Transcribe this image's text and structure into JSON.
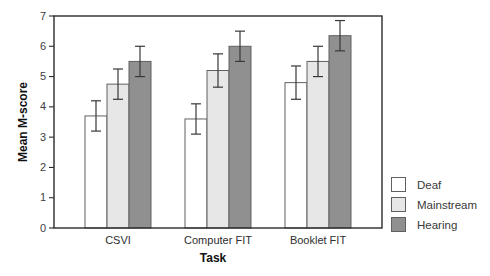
{
  "chart_data": {
    "type": "bar",
    "title": "",
    "xlabel": "Task",
    "ylabel": "Mean M-score",
    "categories": [
      "CSVI",
      "Computer FIT",
      "Booklet FIT"
    ],
    "series": [
      {
        "name": "Deaf",
        "color": "#ffffff",
        "values": [
          3.7,
          3.6,
          4.8
        ],
        "errors": [
          0.5,
          0.5,
          0.55
        ]
      },
      {
        "name": "Mainstream",
        "color": "#e7e7e7",
        "values": [
          4.75,
          5.2,
          5.5
        ],
        "errors": [
          0.5,
          0.55,
          0.5
        ]
      },
      {
        "name": "Hearing",
        "color": "#909090",
        "values": [
          5.5,
          6.0,
          6.35
        ],
        "errors": [
          0.5,
          0.5,
          0.5
        ]
      }
    ],
    "ylim": [
      0,
      7
    ],
    "yticks": [
      0,
      1,
      2,
      3,
      4,
      5,
      6,
      7
    ],
    "grid": false,
    "error_bars": true,
    "legend_position": "outside-right-bottom",
    "axis_color": "#222222",
    "bar_border_color": "#606060",
    "error_bar_color": "#383838"
  }
}
